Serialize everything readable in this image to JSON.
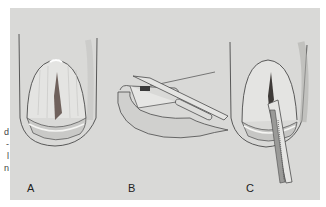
{
  "figure": {
    "panels": [
      {
        "label": "A",
        "description": "Nail plate with longitudinal pigmented streak"
      },
      {
        "label": "B",
        "description": "Side view of nail with scalpel lifting nail plate"
      },
      {
        "label": "C",
        "description": "Nail plate with instrument inserted beneath, removing specimen"
      }
    ],
    "margin_text_fragments": [
      "d",
      "-",
      "l",
      "n"
    ],
    "colors": {
      "background": "#d9d9d7",
      "outline": "#4a4a4a",
      "pigment": "#5a4a44"
    }
  }
}
